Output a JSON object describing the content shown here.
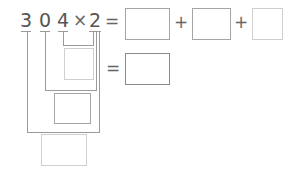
{
  "problem": {
    "digits": [
      "3",
      "0",
      "4"
    ],
    "times_symbol": "×",
    "multiplier": "2",
    "equals": "=",
    "plus": "+"
  },
  "answer_boxes": {
    "sum_terms": [
      "",
      "",
      ""
    ],
    "partial_ones": "",
    "partial_ones_result": "",
    "partial_tens": "",
    "partial_hundreds": ""
  },
  "colors": {
    "text": "#555555",
    "line": "#9a9a9a",
    "box_dark": "#8a8a8a",
    "box_light": "#cfcfcf"
  }
}
